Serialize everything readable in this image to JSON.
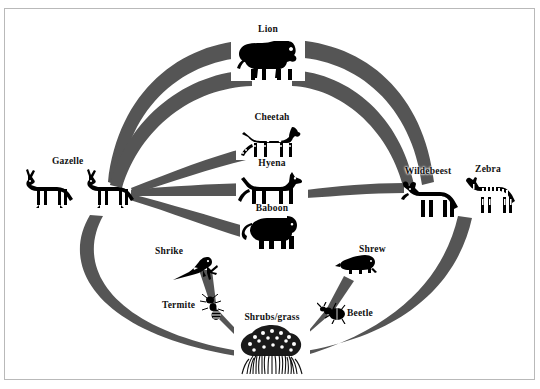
{
  "diagram": {
    "background": "#ffffff",
    "arrow_color": "#555555",
    "border_color": "#b9b9b9",
    "label_color": "#111111"
  },
  "nodes": [
    {
      "id": "lion",
      "label": "Lion",
      "x": 268,
      "y": 55,
      "label_dx": 0,
      "label_dy": -28,
      "w": 74,
      "h": 46
    },
    {
      "id": "cheetah",
      "label": "Cheetah",
      "x": 272,
      "y": 138,
      "label_dx": 0,
      "label_dy": -24,
      "w": 68,
      "h": 40
    },
    {
      "id": "hyena",
      "label": "Hyena",
      "x": 272,
      "y": 182,
      "label_dx": 0,
      "label_dy": -23,
      "w": 70,
      "h": 38
    },
    {
      "id": "baboon",
      "label": "Baboon",
      "x": 272,
      "y": 225,
      "label_dx": 0,
      "label_dy": -22,
      "w": 62,
      "h": 36
    },
    {
      "id": "gazelle_a",
      "label": "",
      "x": 44,
      "y": 188,
      "label_dx": 0,
      "label_dy": 0,
      "w": 58,
      "h": 38
    },
    {
      "id": "gazelle_b",
      "label": "Gazelle",
      "x": 105,
      "y": 188,
      "label_dx": -34,
      "label_dy": -28,
      "w": 58,
      "h": 38
    },
    {
      "id": "wildebeest",
      "label": "Wildebeest",
      "x": 428,
      "y": 188,
      "label_dx": 0,
      "label_dy": -28,
      "w": 62,
      "h": 40
    },
    {
      "id": "zebra",
      "label": "Zebra",
      "x": 488,
      "y": 190,
      "label_dx": 0,
      "label_dy": -30,
      "w": 58,
      "h": 38
    },
    {
      "id": "shrike",
      "label": "Shrike",
      "x": 199,
      "y": 258,
      "label_dx": -28,
      "label_dy": -6,
      "w": 56,
      "h": 30
    },
    {
      "id": "termite",
      "label": "Termite",
      "x": 213,
      "y": 305,
      "label_dx": -30,
      "label_dy": 0,
      "w": 26,
      "h": 22
    },
    {
      "id": "shrubs",
      "label": "Shrubs/grass",
      "x": 272,
      "y": 340,
      "label_dx": 0,
      "label_dy": -36,
      "w": 78,
      "h": 48
    },
    {
      "id": "beetle",
      "label": "Beetle",
      "x": 332,
      "y": 313,
      "label_dx": 28,
      "label_dy": 0,
      "w": 30,
      "h": 20
    },
    {
      "id": "shrew",
      "label": "Shrew",
      "x": 355,
      "y": 263,
      "label_dx": 26,
      "label_dy": -12,
      "w": 40,
      "h": 22
    }
  ],
  "links": [
    {
      "from": "gazelle_b",
      "to": "lion",
      "kind": "arc-outer-upper-left"
    },
    {
      "from": "gazelle_b",
      "to": "lion",
      "kind": "arc-outer-lower-left"
    },
    {
      "from": "zebra",
      "to": "lion",
      "kind": "arc-outer-upper-right"
    },
    {
      "from": "wildebeest",
      "to": "lion",
      "kind": "arc-outer-lower-right"
    },
    {
      "from": "gazelle_b",
      "to": "cheetah",
      "kind": "arc-mid"
    },
    {
      "from": "gazelle_b",
      "to": "hyena",
      "kind": "arc-flat"
    },
    {
      "from": "gazelle_b",
      "to": "baboon",
      "kind": "arc-mid-low"
    },
    {
      "from": "wildebeest",
      "to": "hyena",
      "kind": "arc-flat-right"
    },
    {
      "from": "shrubs",
      "to": "gazelle_b",
      "kind": "arc-bottom-left"
    },
    {
      "from": "shrubs",
      "to": "zebra",
      "kind": "arc-bottom-right"
    },
    {
      "from": "termite",
      "to": "shrike",
      "kind": "taper-short"
    },
    {
      "from": "shrubs",
      "to": "termite",
      "kind": "thin-line"
    },
    {
      "from": "beetle",
      "to": "shrew",
      "kind": "taper-short"
    },
    {
      "from": "shrubs",
      "to": "beetle",
      "kind": "thin-line"
    }
  ]
}
